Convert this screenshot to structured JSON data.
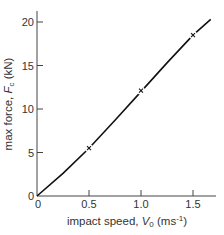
{
  "chart_data": {
    "type": "line",
    "title": "",
    "xlabel": "impact speed, V0 (ms-1)",
    "ylabel": "max force, Fc (kN)",
    "xlabel_parts": {
      "prefix": "impact speed, ",
      "var": "V",
      "sub": "0",
      "units_open": " (ms",
      "sup": "-1",
      "units_close": ")"
    },
    "ylabel_parts": {
      "prefix": "max force, ",
      "var": "F",
      "sub": "c",
      "units": " (kN)"
    },
    "xlim": [
      0,
      1.72
    ],
    "ylim": [
      0,
      21
    ],
    "x_ticks": [
      0,
      0.5,
      1.0,
      1.5
    ],
    "x_tick_labels": [
      "0",
      "0.5",
      "1.0",
      "1.5"
    ],
    "y_ticks": [
      0,
      5,
      10,
      15,
      20
    ],
    "y_tick_labels": [
      "0",
      "5",
      "10",
      "15",
      "20"
    ],
    "grid": false,
    "legend": null,
    "series": [
      {
        "name": "fitted curve",
        "style": "solid line",
        "x": [
          0,
          0.25,
          0.5,
          0.75,
          1.0,
          1.25,
          1.5,
          1.67
        ],
        "y": [
          0,
          2.6,
          5.5,
          8.7,
          12.0,
          15.3,
          18.5,
          20.3
        ]
      },
      {
        "name": "measured points",
        "style": "x markers",
        "x": [
          0.5,
          1.0,
          1.5
        ],
        "y": [
          5.5,
          12.1,
          18.5
        ]
      }
    ]
  }
}
